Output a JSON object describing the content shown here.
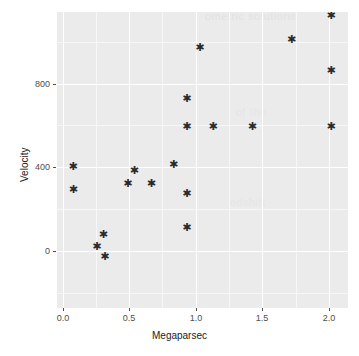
{
  "chart_data": {
    "type": "scatter",
    "title": "",
    "xlabel": "Megaparsec",
    "ylabel": "Velocity",
    "xlim": [
      -0.09,
      2.13
    ],
    "ylim": [
      -460,
      1105
    ],
    "xticks": [
      0.0,
      0.5,
      1.0,
      1.5,
      2.0
    ],
    "xticklabels": [
      "0.0",
      "0.5",
      "1.0",
      "1.5",
      "2.0"
    ],
    "yticks": [
      0,
      400,
      800
    ],
    "yticklabels": [
      "0",
      "400",
      "800"
    ],
    "grid": true,
    "legend": null,
    "marker": "star",
    "marker_color": "#2b2b2b",
    "panel_background": "#ebebeb",
    "gridline_color": "#ffffff",
    "points": [
      {
        "x": 0.032,
        "y": 290
      },
      {
        "x": 0.034,
        "y": 170
      },
      {
        "x": 0.214,
        "y": -130
      },
      {
        "x": 0.263,
        "y": -70
      },
      {
        "x": 0.275,
        "y": -185
      },
      {
        "x": 0.45,
        "y": 200
      },
      {
        "x": 0.5,
        "y": 270
      },
      {
        "x": 0.63,
        "y": 200
      },
      {
        "x": 0.8,
        "y": 300
      },
      {
        "x": 0.9,
        "y": 650
      },
      {
        "x": 0.9,
        "y": 500
      },
      {
        "x": 0.9,
        "y": 150
      },
      {
        "x": 0.9,
        "y": -30
      },
      {
        "x": 1.0,
        "y": 920
      },
      {
        "x": 1.1,
        "y": 500
      },
      {
        "x": 1.4,
        "y": 500
      },
      {
        "x": 1.7,
        "y": 960
      },
      {
        "x": 2.0,
        "y": 1090
      },
      {
        "x": 2.0,
        "y": 800
      },
      {
        "x": 2.0,
        "y": 500
      }
    ]
  },
  "marker_glyph": "✱",
  "background_artifacts": [
    {
      "text": "ometric solutions",
      "x": 205,
      "y": 14
    },
    {
      "text": "of the",
      "x": 236,
      "y": 110
    },
    {
      "text": "edshift",
      "x": 230,
      "y": 200
    }
  ]
}
